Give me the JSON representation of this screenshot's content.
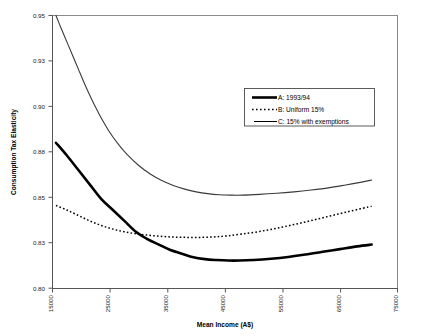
{
  "chart_data": {
    "type": "line",
    "title": "",
    "xlabel": "Mean Income (A$)",
    "ylabel": "Consumption Tax Elasticity",
    "xlim": [
      15000,
      75000
    ],
    "ylim": [
      0.8,
      0.95
    ],
    "grid": false,
    "legend_position": "upper-right-inside",
    "xticks": [
      15000,
      25000,
      35000,
      45000,
      55000,
      65000,
      75000
    ],
    "xtick_labels": [
      "15000",
      "25000",
      "35000",
      "45000",
      "55000",
      "65000",
      "75000"
    ],
    "yticks": [
      0.8,
      0.825,
      0.85,
      0.875,
      0.9,
      0.925,
      0.95
    ],
    "ytick_labels": [
      "0.80",
      "0.83",
      "0.85",
      "0.88",
      "0.90",
      "0.93",
      "0.95"
    ],
    "series": [
      {
        "key": "A",
        "name": "A: 1993/94",
        "style": "thick-solid",
        "x": [
          15600,
          17500,
          19500,
          21500,
          23500,
          25500,
          27500,
          29500,
          31500,
          33500,
          35500,
          37500,
          39500,
          41500,
          43500,
          45500,
          47500,
          50000,
          53000,
          56000,
          59000,
          62000,
          65000,
          68000,
          70500
        ],
        "y": [
          0.88,
          0.873,
          0.865,
          0.857,
          0.849,
          0.843,
          0.837,
          0.831,
          0.827,
          0.824,
          0.821,
          0.819,
          0.817,
          0.816,
          0.8155,
          0.8152,
          0.8152,
          0.8155,
          0.8162,
          0.8172,
          0.8185,
          0.82,
          0.8215,
          0.823,
          0.824
        ]
      },
      {
        "key": "B",
        "name": "B: Uniform 15%",
        "style": "dotted",
        "x": [
          15600,
          17500,
          19500,
          21500,
          23500,
          25500,
          27500,
          29500,
          31500,
          33500,
          35500,
          37500,
          39500,
          41500,
          43500,
          45500,
          48000,
          51000,
          54000,
          57000,
          60000,
          63000,
          66000,
          69000,
          70500
        ],
        "y": [
          0.8455,
          0.843,
          0.84,
          0.837,
          0.8345,
          0.8325,
          0.831,
          0.83,
          0.8292,
          0.8286,
          0.8282,
          0.828,
          0.8279,
          0.828,
          0.8283,
          0.8288,
          0.8298,
          0.8312,
          0.833,
          0.835,
          0.8372,
          0.8395,
          0.8418,
          0.844,
          0.845
        ]
      },
      {
        "key": "C",
        "name": "C: 15% with exemptions",
        "style": "thin-solid",
        "x": [
          15600,
          16500,
          17500,
          18500,
          19500,
          20500,
          21500,
          22500,
          23500,
          25000,
          26500,
          28000,
          30000,
          32000,
          34000,
          36000,
          38000,
          40000,
          42000,
          44000,
          46000,
          48000,
          51000,
          54000,
          57000,
          60000,
          63000,
          66000,
          69000,
          70500
        ],
        "y": [
          0.95,
          0.943,
          0.9355,
          0.928,
          0.9205,
          0.913,
          0.906,
          0.8995,
          0.8935,
          0.8855,
          0.879,
          0.8735,
          0.8675,
          0.8628,
          0.8592,
          0.8565,
          0.8545,
          0.853,
          0.852,
          0.8514,
          0.8512,
          0.8512,
          0.8516,
          0.8522,
          0.853,
          0.854,
          0.8552,
          0.8568,
          0.8585,
          0.8595
        ]
      }
    ]
  },
  "legend": {
    "items": [
      {
        "label": "A:  1993/94",
        "style": "thick-solid"
      },
      {
        "label": "B: Uniform 15%",
        "style": "dotted"
      },
      {
        "label": "C: 15% with exemptions",
        "style": "thin-solid"
      }
    ]
  },
  "axes": {
    "x_title": "Mean Income (A$)",
    "y_title": "Consumption Tax Elasticity",
    "x_labels": [
      "15000",
      "25000",
      "35000",
      "45000",
      "55000",
      "65000",
      "75000"
    ],
    "y_labels": [
      "0.95",
      "0.93",
      "0.90",
      "0.88",
      "0.85",
      "0.83",
      "0.80"
    ]
  },
  "colors": {
    "line": "#000000",
    "frame": "#8a8a8a",
    "text": "#000000",
    "background": "#ffffff"
  }
}
